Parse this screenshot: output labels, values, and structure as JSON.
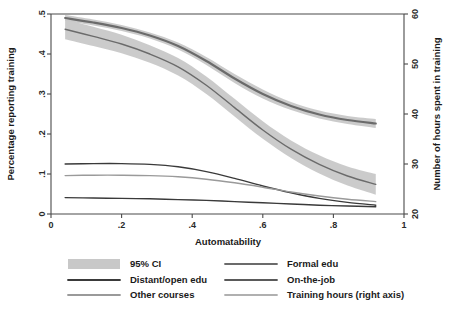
{
  "chart_data": {
    "type": "line",
    "title": "",
    "xlabel": "Automatability",
    "ylabel": "Percentage reporting training",
    "y2label": "Number of hours spent in training",
    "xlim": [
      0,
      1
    ],
    "ylim": [
      0,
      0.5
    ],
    "y2lim": [
      20,
      60
    ],
    "grid": false,
    "legend_position": "below",
    "xticks": [
      "0",
      ".2",
      ".4",
      ".6",
      ".8",
      "1"
    ],
    "xtick_values": [
      0,
      0.2,
      0.4,
      0.6,
      0.8,
      1
    ],
    "yticks": [
      "0",
      ".1",
      ".2",
      ".3",
      ".4",
      ".5"
    ],
    "ytick_values": [
      0,
      0.1,
      0.2,
      0.3,
      0.4,
      0.5
    ],
    "y2ticks": [
      "20",
      "30",
      "40",
      "50",
      "60"
    ],
    "y2tick_values": [
      20,
      30,
      40,
      50,
      60
    ],
    "x": [
      0.04,
      0.12,
      0.2,
      0.28,
      0.36,
      0.44,
      0.52,
      0.6,
      0.68,
      0.76,
      0.84,
      0.92
    ],
    "series": [
      {
        "name": "Training hours (right axis)",
        "axis": "right",
        "color": "#6b6b6b",
        "width": 2.2,
        "values": [
          59.2,
          58.3,
          57.2,
          55.7,
          53.6,
          50.6,
          47.1,
          44.0,
          41.6,
          39.9,
          38.8,
          38.1
        ],
        "ci_upper": [
          59.8,
          58.9,
          57.8,
          56.3,
          54.3,
          51.4,
          48.0,
          44.9,
          42.4,
          40.7,
          39.6,
          39.0
        ],
        "ci_lower": [
          58.6,
          57.7,
          56.6,
          55.1,
          52.9,
          49.8,
          46.2,
          43.1,
          40.8,
          39.1,
          38.0,
          37.2
        ]
      },
      {
        "name": "Formal edu",
        "axis": "left",
        "color": "#6b6b6b",
        "width": 1.4,
        "values": [
          0.462,
          0.444,
          0.425,
          0.4,
          0.368,
          0.322,
          0.266,
          0.21,
          0.162,
          0.124,
          0.095,
          0.074
        ],
        "ci_upper": [
          0.487,
          0.468,
          0.448,
          0.422,
          0.39,
          0.344,
          0.288,
          0.232,
          0.184,
          0.147,
          0.119,
          0.1
        ],
        "ci_lower": [
          0.437,
          0.42,
          0.402,
          0.378,
          0.346,
          0.3,
          0.244,
          0.188,
          0.14,
          0.101,
          0.071,
          0.048
        ]
      },
      {
        "name": "Distant/open edu",
        "axis": "left",
        "color": "#3a3a3a",
        "width": 1.4,
        "values": [
          0.125,
          0.126,
          0.126,
          0.124,
          0.118,
          0.106,
          0.089,
          0.07,
          0.053,
          0.039,
          0.029,
          0.022
        ]
      },
      {
        "name": "Other courses",
        "axis": "left",
        "color": "#9a9a9a",
        "width": 1.4,
        "values": [
          0.096,
          0.097,
          0.097,
          0.096,
          0.093,
          0.087,
          0.078,
          0.067,
          0.055,
          0.045,
          0.037,
          0.031
        ]
      },
      {
        "name": "On-the-job",
        "axis": "left",
        "color": "#3a3a3a",
        "width": 1.4,
        "values": [
          0.041,
          0.04,
          0.039,
          0.038,
          0.036,
          0.034,
          0.031,
          0.028,
          0.025,
          0.022,
          0.02,
          0.018
        ]
      }
    ],
    "ci_band_color": "#c8c8c8",
    "ci_label": "95% CI"
  },
  "legend": {
    "items": [
      {
        "label": "95% CI",
        "marker": "band",
        "color": "#c8c8c8"
      },
      {
        "label": "Formal edu",
        "marker": "line",
        "color": "#6b6b6b"
      },
      {
        "label": "Distant/open edu",
        "marker": "line",
        "color": "#3a3a3a"
      },
      {
        "label": "On-the-job",
        "marker": "line",
        "color": "#5a5a5a"
      },
      {
        "label": "Other courses",
        "marker": "line",
        "color": "#9a9a9a"
      },
      {
        "label": "Training hours (right axis)",
        "marker": "line",
        "color": "#b0b0b0"
      }
    ]
  }
}
